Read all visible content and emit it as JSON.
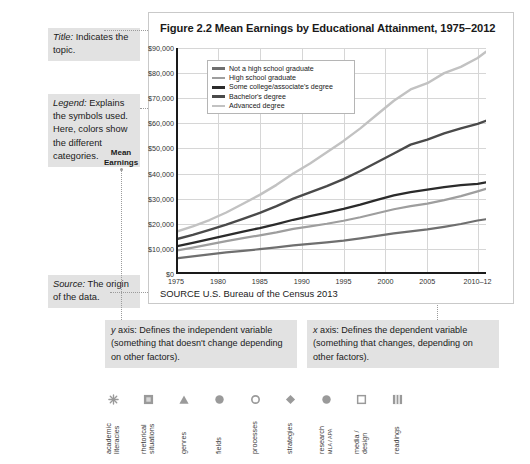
{
  "annotations": {
    "title_note": {
      "term": "Title:",
      "text": " Indicates the topic."
    },
    "legend_note": {
      "term": "Legend:",
      "text": " Explains the symbols used. Here, colors show the different categories."
    },
    "source_note": {
      "term": "Source:",
      "text": " The origin of the data."
    },
    "y_axis_note": {
      "term": "y",
      "text": " axis: Defines the independent variable (something that doesn't change depending on other factors)."
    },
    "x_axis_note": {
      "term": "x",
      "text": " axis: Defines the dependent variable (something that changes, depending on other factors)."
    }
  },
  "figure": {
    "title": "Figure 2.2  Mean Earnings by Educational Attainment, 1975–2012",
    "source": "SOURCE  U.S. Bureau of the Census 2013",
    "axis_label": "Mean\nEarnings"
  },
  "chart_data": {
    "type": "line",
    "title": "Figure 2.2  Mean Earnings by Educational Attainment, 1975–2012",
    "xlabel": "",
    "ylabel": "Mean Earnings",
    "ylim": [
      0,
      90000
    ],
    "ytick_labels": [
      "$0",
      "$10,000",
      "$20,000",
      "$30,000",
      "$40,000",
      "$50,000",
      "$60,000",
      "$70,000",
      "$80,000",
      "$90,000"
    ],
    "ytick_values": [
      0,
      10000,
      20000,
      30000,
      40000,
      50000,
      60000,
      70000,
      80000,
      90000
    ],
    "xtick_labels": [
      "1975",
      "1980",
      "1985",
      "1990",
      "1995",
      "2000",
      "2005",
      "2010–12"
    ],
    "xtick_values": [
      1975,
      1980,
      1985,
      1990,
      1995,
      2000,
      2005,
      2011
    ],
    "xlim": [
      1975,
      2012
    ],
    "grid": true,
    "legend_position": "top-left-inside",
    "series": [
      {
        "name": "Not a high school graduate",
        "color": "#6f6f6f",
        "width": 2.2,
        "x": [
          1975,
          1977,
          1979,
          1981,
          1983,
          1985,
          1987,
          1989,
          1991,
          1993,
          1995,
          1997,
          1999,
          2001,
          2003,
          2005,
          2007,
          2009,
          2011,
          2012
        ],
        "values": [
          6200,
          7000,
          7800,
          8600,
          9200,
          9900,
          10600,
          11400,
          12000,
          12600,
          13300,
          14200,
          15200,
          16200,
          17000,
          17800,
          18800,
          19900,
          21300,
          21800
        ]
      },
      {
        "name": "High school graduate",
        "color": "#9e9e9e",
        "width": 2.2,
        "x": [
          1975,
          1977,
          1979,
          1981,
          1983,
          1985,
          1987,
          1989,
          1991,
          1993,
          1995,
          1997,
          1999,
          2001,
          2003,
          2005,
          2007,
          2009,
          2011,
          2012
        ],
        "values": [
          9300,
          10500,
          11800,
          13100,
          14300,
          15400,
          16600,
          18000,
          19000,
          20000,
          21200,
          22600,
          24200,
          25800,
          27000,
          28000,
          29400,
          31000,
          32900,
          33900
        ]
      },
      {
        "name": "Some college/associate's degree",
        "color": "#2b2b2b",
        "width": 2.3,
        "x": [
          1975,
          1977,
          1979,
          1981,
          1983,
          1985,
          1987,
          1989,
          1991,
          1993,
          1995,
          1997,
          1999,
          2001,
          2003,
          2005,
          2007,
          2009,
          2011,
          2012
        ],
        "values": [
          11000,
          12400,
          13900,
          15400,
          16900,
          18300,
          19900,
          21600,
          23000,
          24400,
          25900,
          27600,
          29500,
          31300,
          32600,
          33600,
          34600,
          35400,
          35900,
          36500
        ]
      },
      {
        "name": "Bachelor's degree",
        "color": "#4a4a4a",
        "width": 2.4,
        "x": [
          1975,
          1977,
          1979,
          1981,
          1983,
          1985,
          1987,
          1989,
          1991,
          1993,
          1995,
          1997,
          1999,
          2001,
          2003,
          2005,
          2007,
          2009,
          2011,
          2012
        ],
        "values": [
          13800,
          15600,
          17600,
          19700,
          22000,
          24300,
          27000,
          30000,
          32500,
          35000,
          37800,
          41000,
          44500,
          48000,
          51500,
          53500,
          56000,
          58000,
          59800,
          61000
        ]
      },
      {
        "name": "Advanced degree",
        "color": "#c2c2c2",
        "width": 2.4,
        "x": [
          1975,
          1977,
          1979,
          1981,
          1983,
          1985,
          1987,
          1989,
          1991,
          1993,
          1995,
          1997,
          1999,
          2001,
          2003,
          2005,
          2007,
          2009,
          2011,
          2012
        ],
        "values": [
          16800,
          19000,
          21500,
          24500,
          28000,
          31500,
          35500,
          40000,
          44000,
          48500,
          53000,
          58000,
          63500,
          69000,
          73500,
          76000,
          80000,
          82500,
          86000,
          88500
        ]
      }
    ]
  },
  "icon_strip": [
    {
      "name": "academic-literacies",
      "icon": "starburst",
      "label": "academic\nliteracies",
      "sub": ""
    },
    {
      "name": "rhetorical-situations",
      "icon": "filled-square",
      "label": "rhetorical\nsituations",
      "sub": ""
    },
    {
      "name": "genres",
      "icon": "triangle",
      "label": "genres",
      "sub": ""
    },
    {
      "name": "fields",
      "icon": "circle",
      "label": "fields",
      "sub": ""
    },
    {
      "name": "processes",
      "icon": "open-circle",
      "label": "processes",
      "sub": ""
    },
    {
      "name": "strategies",
      "icon": "diamond",
      "label": "strategies",
      "sub": ""
    },
    {
      "name": "research",
      "icon": "circle",
      "label": "research",
      "sub": "MLA / APA"
    },
    {
      "name": "media-design",
      "icon": "open-square",
      "label": "media /\ndesign",
      "sub": ""
    },
    {
      "name": "readings",
      "icon": "striped-square",
      "label": "readings",
      "sub": ""
    }
  ]
}
